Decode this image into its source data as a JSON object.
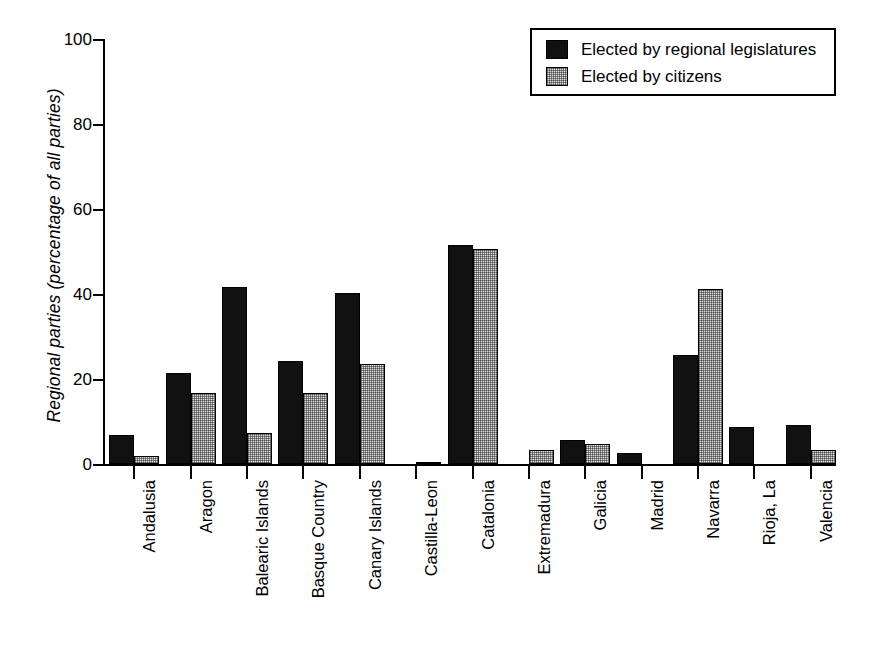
{
  "chart_data": {
    "type": "bar",
    "title": "",
    "xlabel": "",
    "ylabel": "Regional parties (percentage of all parties)",
    "ylim": [
      0,
      100
    ],
    "yticks": [
      0,
      20,
      40,
      60,
      80,
      100
    ],
    "ytick_labels": [
      "0",
      "20",
      "40",
      "60",
      "80",
      "100"
    ],
    "grid": false,
    "legend_position": "top-right",
    "categories": [
      "Andalusia",
      "Aragon",
      "Balearic Islands",
      "Basque Country",
      "Canary Islands",
      "Castilla-Leon",
      "Catalonia",
      "Extremadura",
      "Galicia",
      "Madrid",
      "Navarra",
      "Rioja, La",
      "Valencia"
    ],
    "series": [
      {
        "name": "Elected by regional legislatures",
        "color": "#111111",
        "values": [
          6.8,
          21.5,
          41.6,
          24.2,
          40.3,
          0.0,
          51.6,
          0.0,
          5.6,
          2.5,
          25.6,
          8.7,
          9.2
        ]
      },
      {
        "name": "Elected by citizens",
        "color": "#dcdcdc",
        "values": [
          1.8,
          16.8,
          7.3,
          16.8,
          23.6,
          0.3,
          50.6,
          3.3,
          4.6,
          0.0,
          41.2,
          0.0,
          3.4
        ]
      }
    ]
  },
  "legend": {
    "items": [
      {
        "label": "Elected by regional legislatures",
        "swatch": "dark"
      },
      {
        "label": "Elected by citizens",
        "swatch": "light"
      }
    ]
  }
}
